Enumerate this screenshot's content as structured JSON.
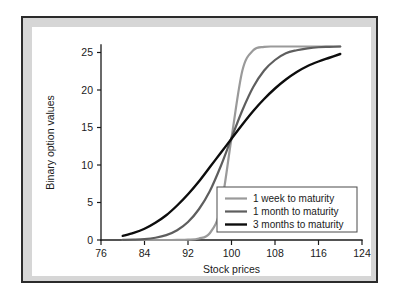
{
  "figure": {
    "background_color": "#d6d6d6",
    "frame_color": "#2b2b2b",
    "canvas_color": "#ffffff"
  },
  "chart_data": {
    "type": "line",
    "title": "",
    "xlabel": "Stock prices",
    "ylabel": "Binary option values",
    "xlim": [
      76,
      124
    ],
    "ylim": [
      0,
      26
    ],
    "xticks": [
      76,
      84,
      92,
      100,
      108,
      116,
      124
    ],
    "yticks": [
      0,
      5,
      10,
      15,
      20,
      25
    ],
    "xtick_labels": [
      "76",
      "84",
      "92",
      "100",
      "108",
      "116",
      "124"
    ],
    "ytick_labels": [
      "0",
      "5",
      "10",
      "15",
      "20",
      "25"
    ],
    "grid": false,
    "legend_position": "lower right",
    "x": [
      80,
      82,
      84,
      86,
      88,
      90,
      92,
      94,
      96,
      98,
      100,
      102,
      104,
      106,
      108,
      110,
      112,
      114,
      116,
      118,
      120
    ],
    "series": [
      {
        "name": "1 week to maturity",
        "color": "#9a9a9a",
        "linewidth": 2.2,
        "values": [
          0.0,
          0.0,
          0.0,
          0.0,
          0.0,
          0.01,
          0.04,
          0.2,
          0.9,
          4.2,
          13.6,
          22.6,
          25.3,
          25.75,
          25.8,
          25.8,
          25.8,
          25.8,
          25.8,
          25.8,
          25.8
        ]
      },
      {
        "name": "1 month to maturity",
        "color": "#5e5e5e",
        "linewidth": 2.2,
        "values": [
          0.02,
          0.05,
          0.12,
          0.3,
          0.65,
          1.3,
          2.4,
          4.1,
          6.5,
          9.8,
          13.6,
          17.3,
          20.4,
          22.6,
          24.0,
          24.9,
          25.3,
          25.55,
          25.7,
          25.75,
          25.8
        ]
      },
      {
        "name": "3 months to maturity",
        "color": "#0d0d0d",
        "linewidth": 2.4,
        "values": [
          0.55,
          0.95,
          1.5,
          2.3,
          3.3,
          4.6,
          6.1,
          7.8,
          9.7,
          11.6,
          13.5,
          15.4,
          17.2,
          18.8,
          20.2,
          21.4,
          22.4,
          23.2,
          23.8,
          24.3,
          24.8
        ]
      }
    ]
  }
}
